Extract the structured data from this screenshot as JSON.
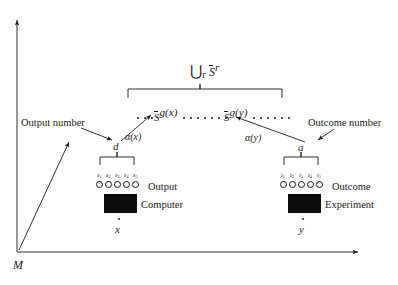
{
  "figure": {
    "type": "conceptual-diagram",
    "background": "#ffffff",
    "ink_color": "#1a1a1a"
  },
  "axes": {
    "origin_label": "M",
    "y_axis_name": "vertical-axis",
    "x_axis_name": "horizontal-axis"
  },
  "labels": {
    "output_number": "Output number",
    "outcome_number": "Outcome number",
    "output": "Output",
    "outcome": "Outcome",
    "computer": "Computer",
    "experiment": "Experiment"
  },
  "math": {
    "union_prefix": "⋃",
    "union_sub": "r",
    "union_base": "S",
    "union_sup": "r",
    "set_x_base": "S",
    "set_x_sup": "g(x)",
    "set_y_base": "S",
    "set_y_sup": "g(y)",
    "map_x": "α(x)",
    "map_y": "α(y)",
    "d_symbol": "d",
    "a_symbol": "a",
    "x_symbol": "x",
    "y_symbol": "y"
  },
  "output_register": {
    "count": 5,
    "labels": [
      "s",
      "s",
      "s",
      "s",
      "s"
    ],
    "subscripts": [
      "1",
      "2",
      "3",
      "4",
      "5"
    ]
  },
  "outcome_register": {
    "count": 5,
    "labels": [
      "t",
      "t",
      "t",
      "t",
      "t"
    ],
    "subscripts": [
      "1",
      "2",
      "3",
      "4",
      "5"
    ]
  },
  "dot_sequence": {
    "left_dots": 3,
    "middle_dots": 7,
    "right_dots": 6,
    "description": "row of discrete points representing the union of sets"
  }
}
